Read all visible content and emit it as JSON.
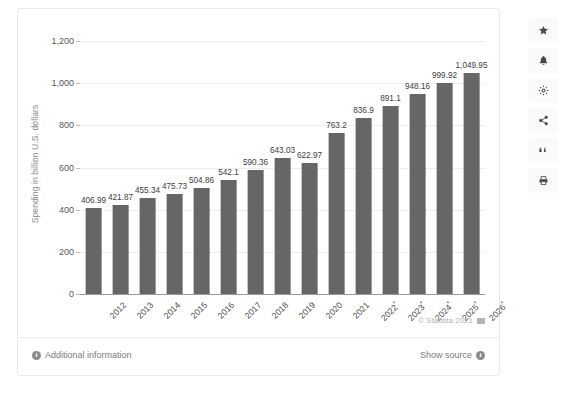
{
  "chart_data": {
    "type": "bar",
    "title": "",
    "xlabel": "",
    "ylabel": "Spending in billion U.S. dollars",
    "ylim": [
      0,
      1200
    ],
    "yticks": [
      "0",
      "200",
      "400",
      "600",
      "800",
      "1,000",
      "1,200"
    ],
    "ytick_values": [
      0,
      200,
      400,
      600,
      800,
      1000,
      1200
    ],
    "grid": true,
    "legend": "none",
    "categories": [
      "2012",
      "2013",
      "2014",
      "2015",
      "2016",
      "2017",
      "2018",
      "2019",
      "2020",
      "2021",
      "2022*",
      "2023*",
      "2024*",
      "2025*",
      "2026*"
    ],
    "values": [
      406.99,
      421.87,
      455.34,
      475.73,
      504.86,
      542.1,
      590.36,
      643.03,
      622.97,
      763.2,
      836.9,
      891.1,
      948.16,
      999.92,
      1049.95
    ],
    "data_labels": [
      "406.99",
      "421.87",
      "455.34",
      "475.73",
      "504.86",
      "542.1",
      "590.36",
      "643.03",
      "622.97",
      "763.2",
      "836.9",
      "891.1",
      "948.16",
      "999.92",
      "1,049.95"
    ],
    "bar_color": "#666666",
    "gridline_color": "#ededed"
  },
  "footer": {
    "additional_information": "Additional information",
    "show_source": "Show source",
    "copyright": "© Statista 2021"
  },
  "toolbar": {
    "items": [
      {
        "name": "star-icon",
        "label": "Favorite"
      },
      {
        "name": "bell-icon",
        "label": "Notify"
      },
      {
        "name": "gear-icon",
        "label": "Settings"
      },
      {
        "name": "share-icon",
        "label": "Share"
      },
      {
        "name": "quote-icon",
        "label": "Cite"
      },
      {
        "name": "print-icon",
        "label": "Print"
      }
    ]
  }
}
